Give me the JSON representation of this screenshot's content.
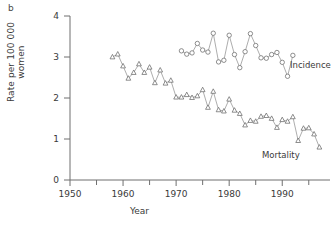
{
  "panel": {
    "label": "b"
  },
  "chart_data": {
    "type": "line",
    "title": "",
    "xlabel": "Year",
    "ylabel": "Rate per 100 000 women",
    "xlim": [
      1950,
      1999
    ],
    "ylim": [
      0,
      4
    ],
    "yticks": [
      0,
      1,
      2,
      3,
      4
    ],
    "ytick_labels": [
      "0",
      "1",
      "2",
      "3",
      "4"
    ],
    "xticks": [
      1950,
      1960,
      1970,
      1980,
      1990
    ],
    "xtick_labels": [
      "1950",
      "1960",
      "1970",
      "1980",
      "1990"
    ],
    "xminor_ticks": [
      1955,
      1965,
      1975,
      1985,
      1995
    ],
    "grid": false,
    "legend_position": "inline-right",
    "series": [
      {
        "name": "Incidence",
        "marker": "circle",
        "x": [
          1971,
          1972,
          1973,
          1974,
          1975,
          1976,
          1977,
          1978,
          1979,
          1980,
          1981,
          1982,
          1983,
          1984,
          1985,
          1986,
          1987,
          1988,
          1989,
          1990,
          1991,
          1992
        ],
        "values": [
          3.15,
          3.07,
          3.1,
          3.33,
          3.17,
          3.12,
          3.58,
          2.88,
          2.92,
          3.53,
          3.06,
          2.74,
          3.13,
          3.57,
          3.28,
          2.98,
          2.97,
          3.06,
          3.11,
          2.87,
          2.53,
          3.04
        ]
      },
      {
        "name": "Mortality",
        "marker": "triangle",
        "x": [
          1958,
          1959,
          1960,
          1961,
          1962,
          1963,
          1964,
          1965,
          1966,
          1967,
          1968,
          1969,
          1970,
          1971,
          1972,
          1973,
          1974,
          1975,
          1976,
          1977,
          1978,
          1979,
          1980,
          1981,
          1982,
          1983,
          1984,
          1985,
          1986,
          1987,
          1988,
          1989,
          1990,
          1991,
          1992,
          1993,
          1994,
          1995,
          1996,
          1997
        ],
        "values": [
          3.0,
          3.07,
          2.78,
          2.48,
          2.62,
          2.83,
          2.62,
          2.75,
          2.37,
          2.68,
          2.36,
          2.43,
          2.02,
          2.02,
          2.08,
          2.01,
          2.05,
          2.2,
          1.77,
          2.16,
          1.71,
          1.68,
          1.97,
          1.7,
          1.62,
          1.34,
          1.45,
          1.43,
          1.55,
          1.57,
          1.5,
          1.28,
          1.47,
          1.43,
          1.54,
          0.96,
          1.26,
          1.27,
          1.12,
          0.8
        ]
      }
    ]
  }
}
